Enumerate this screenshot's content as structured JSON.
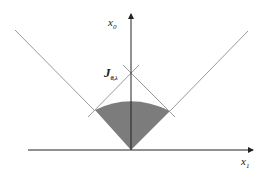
{
  "diagram": {
    "type": "light-cone",
    "axes": {
      "vertical_label": "x",
      "vertical_subscript": "0",
      "horizontal_label": "x",
      "horizontal_subscript": "1"
    },
    "point_label": "J",
    "point_subscript": "θ,λ",
    "colors": {
      "line": "#9a9a9a",
      "axis": "#222222",
      "shade": "#6e6e6e"
    }
  }
}
